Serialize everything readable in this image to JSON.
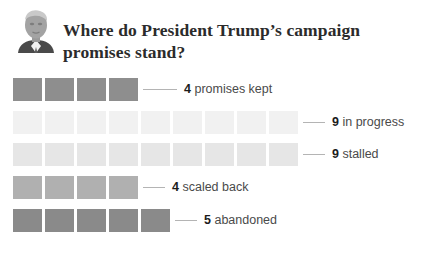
{
  "header": {
    "avatar_alt": "President Trump headshot",
    "title": "Where do President Trump’s campaign promises stand?"
  },
  "chart_data": {
    "type": "bar",
    "title": "Where do President Trump’s campaign promises stand?",
    "subtitle": "",
    "xlabel": "",
    "ylabel": "",
    "unit": "promises",
    "style": "pictogram-unit-blocks",
    "total": 31,
    "categories": [
      "promises kept",
      "in progress",
      "stalled",
      "scaled back",
      "abandoned"
    ],
    "values": [
      4,
      9,
      9,
      4,
      5
    ],
    "colors": [
      "#8e8e8e",
      "#f1f1f1",
      "#e6e6e6",
      "#b0b0b0",
      "#8a8a8a"
    ],
    "legend": "none",
    "grid": false,
    "rows": [
      {
        "count": "4",
        "label": "promises kept",
        "value": 4,
        "color": "#8e8e8e",
        "connector_width": 34
      },
      {
        "count": "9",
        "label": "in progress",
        "value": 9,
        "color": "#f1f1f1",
        "connector_width": 22
      },
      {
        "count": "9",
        "label": "stalled",
        "value": 9,
        "color": "#e6e6e6",
        "connector_width": 22
      },
      {
        "count": "4",
        "label": "scaled back",
        "value": 4,
        "color": "#b0b0b0",
        "connector_width": 22
      },
      {
        "count": "5",
        "label": "abandoned",
        "value": 5,
        "color": "#8a8a8a",
        "connector_width": 22
      }
    ]
  }
}
